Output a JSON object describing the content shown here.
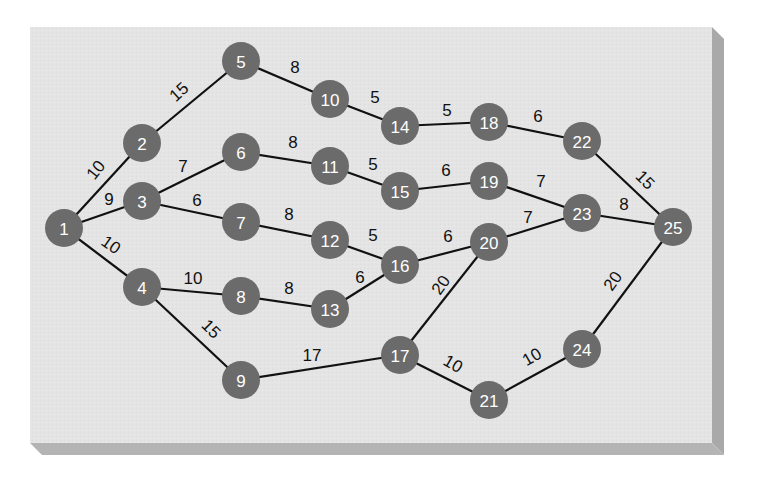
{
  "diagram": {
    "type": "network-graph",
    "panel": {
      "x": 30,
      "y": 27,
      "width": 682,
      "height": 416,
      "face_color": "#e4e4e4",
      "bevel_right_color": "#a9a9a9",
      "bevel_bottom_color": "#b4b4b4",
      "bevel_depth": 12
    },
    "node_style": {
      "radius": 19,
      "fill": "#6b6b6b",
      "text_color": "#ffffff"
    },
    "edge_style": {
      "stroke": "#111111",
      "width": 2.2
    },
    "nodes": [
      {
        "id": "1",
        "x": 64,
        "y": 228
      },
      {
        "id": "2",
        "x": 142,
        "y": 143
      },
      {
        "id": "3",
        "x": 142,
        "y": 201
      },
      {
        "id": "4",
        "x": 142,
        "y": 287
      },
      {
        "id": "5",
        "x": 241,
        "y": 61
      },
      {
        "id": "6",
        "x": 241,
        "y": 152
      },
      {
        "id": "7",
        "x": 241,
        "y": 222
      },
      {
        "id": "8",
        "x": 241,
        "y": 296
      },
      {
        "id": "9",
        "x": 241,
        "y": 380
      },
      {
        "id": "10",
        "x": 330,
        "y": 99
      },
      {
        "id": "11",
        "x": 330,
        "y": 166
      },
      {
        "id": "12",
        "x": 330,
        "y": 240
      },
      {
        "id": "13",
        "x": 330,
        "y": 309
      },
      {
        "id": "14",
        "x": 400,
        "y": 126
      },
      {
        "id": "15",
        "x": 400,
        "y": 191
      },
      {
        "id": "16",
        "x": 400,
        "y": 265
      },
      {
        "id": "17",
        "x": 400,
        "y": 355
      },
      {
        "id": "18",
        "x": 489,
        "y": 122
      },
      {
        "id": "19",
        "x": 489,
        "y": 181
      },
      {
        "id": "20",
        "x": 489,
        "y": 242
      },
      {
        "id": "21",
        "x": 489,
        "y": 400
      },
      {
        "id": "22",
        "x": 582,
        "y": 141
      },
      {
        "id": "23",
        "x": 582,
        "y": 213
      },
      {
        "id": "24",
        "x": 582,
        "y": 349
      },
      {
        "id": "25",
        "x": 673,
        "y": 227
      }
    ],
    "edges": [
      {
        "from": "1",
        "to": "2",
        "weight": "10",
        "lx": 96,
        "ly": 170,
        "rot": -52
      },
      {
        "from": "1",
        "to": "3",
        "weight": "9",
        "lx": 109,
        "ly": 199,
        "rot": 0
      },
      {
        "from": "1",
        "to": "4",
        "weight": "10",
        "lx": 111,
        "ly": 245,
        "rot": 35
      },
      {
        "from": "2",
        "to": "5",
        "weight": "15",
        "lx": 179,
        "ly": 92,
        "rot": -42
      },
      {
        "from": "3",
        "to": "6",
        "weight": "7",
        "lx": 183,
        "ly": 166,
        "rot": 0
      },
      {
        "from": "3",
        "to": "7",
        "weight": "6",
        "lx": 197,
        "ly": 200,
        "rot": 0
      },
      {
        "from": "4",
        "to": "8",
        "weight": "10",
        "lx": 193,
        "ly": 278,
        "rot": 0
      },
      {
        "from": "4",
        "to": "9",
        "weight": "15",
        "lx": 211,
        "ly": 329,
        "rot": 45
      },
      {
        "from": "5",
        "to": "10",
        "weight": "8",
        "lx": 295,
        "ly": 67,
        "rot": 0
      },
      {
        "from": "6",
        "to": "11",
        "weight": "8",
        "lx": 293,
        "ly": 142,
        "rot": 0
      },
      {
        "from": "7",
        "to": "12",
        "weight": "8",
        "lx": 289,
        "ly": 214,
        "rot": 0
      },
      {
        "from": "8",
        "to": "13",
        "weight": "8",
        "lx": 289,
        "ly": 288,
        "rot": 0
      },
      {
        "from": "9",
        "to": "17",
        "weight": "17",
        "lx": 312,
        "ly": 355,
        "rot": 0
      },
      {
        "from": "10",
        "to": "14",
        "weight": "5",
        "lx": 375,
        "ly": 97,
        "rot": 0
      },
      {
        "from": "11",
        "to": "15",
        "weight": "5",
        "lx": 373,
        "ly": 164,
        "rot": 0
      },
      {
        "from": "12",
        "to": "16",
        "weight": "5",
        "lx": 373,
        "ly": 235,
        "rot": 0
      },
      {
        "from": "13",
        "to": "16",
        "weight": "6",
        "lx": 360,
        "ly": 277,
        "rot": 0
      },
      {
        "from": "14",
        "to": "18",
        "weight": "5",
        "lx": 447,
        "ly": 110,
        "rot": 0
      },
      {
        "from": "15",
        "to": "19",
        "weight": "6",
        "lx": 446,
        "ly": 170,
        "rot": 0
      },
      {
        "from": "16",
        "to": "20",
        "weight": "6",
        "lx": 448,
        "ly": 236,
        "rot": 0
      },
      {
        "from": "17",
        "to": "20",
        "weight": "20",
        "lx": 441,
        "ly": 285,
        "rot": -55
      },
      {
        "from": "17",
        "to": "21",
        "weight": "10",
        "lx": 453,
        "ly": 364,
        "rot": 30
      },
      {
        "from": "18",
        "to": "22",
        "weight": "6",
        "lx": 538,
        "ly": 116,
        "rot": 0
      },
      {
        "from": "19",
        "to": "23",
        "weight": "7",
        "lx": 541,
        "ly": 181,
        "rot": 0
      },
      {
        "from": "20",
        "to": "23",
        "weight": "7",
        "lx": 528,
        "ly": 217,
        "rot": 0
      },
      {
        "from": "21",
        "to": "24",
        "weight": "10",
        "lx": 532,
        "ly": 357,
        "rot": -30
      },
      {
        "from": "22",
        "to": "25",
        "weight": "15",
        "lx": 645,
        "ly": 180,
        "rot": 45
      },
      {
        "from": "23",
        "to": "25",
        "weight": "8",
        "lx": 624,
        "ly": 204,
        "rot": 0
      },
      {
        "from": "24",
        "to": "25",
        "weight": "20",
        "lx": 613,
        "ly": 281,
        "rot": -55
      }
    ]
  }
}
